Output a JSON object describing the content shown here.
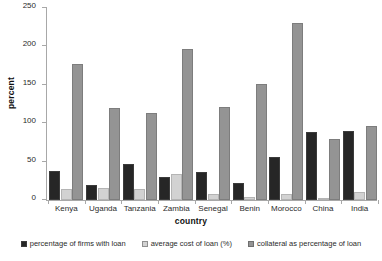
{
  "chart_data": {
    "type": "bar",
    "title": "",
    "xlabel": "country",
    "ylabel": "percent",
    "ylim": [
      0,
      250
    ],
    "yticks": [
      0,
      50,
      100,
      150,
      200,
      250
    ],
    "grid": false,
    "legend_position": "bottom",
    "categories": [
      "Kenya",
      "Uganda",
      "Tanzania",
      "Zambia",
      "Senegal",
      "Benin",
      "Morocco",
      "China",
      "India"
    ],
    "series": [
      {
        "name": "percentage of firms with loan",
        "color": "#262626",
        "values": [
          38,
          19,
          47,
          30,
          37,
          22,
          56,
          88,
          90
        ]
      },
      {
        "name": "average cost of loan (%)",
        "color": "#d2d2d2",
        "values": [
          14,
          16,
          14,
          34,
          8,
          4,
          8,
          3,
          11
        ]
      },
      {
        "name": "collateral as percentage of loan",
        "color": "#949494",
        "values": [
          177,
          120,
          113,
          197,
          121,
          151,
          230,
          80,
          96
        ]
      }
    ]
  }
}
